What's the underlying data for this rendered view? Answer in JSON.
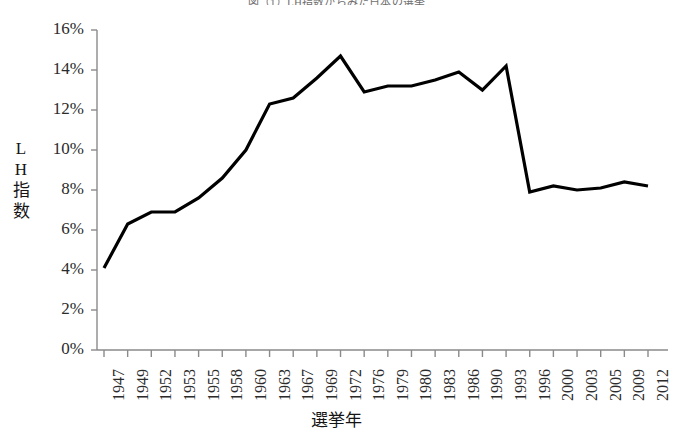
{
  "chart_data": {
    "type": "line",
    "title": "図（1）LH指数からみた日本の選挙",
    "xlabel": "選挙年",
    "ylabel": "LH指数",
    "categories": [
      "1947",
      "1949",
      "1952",
      "1953",
      "1955",
      "1958",
      "1960",
      "1963",
      "1967",
      "1969",
      "1972",
      "1976",
      "1979",
      "1980",
      "1983",
      "1986",
      "1990",
      "1993",
      "1996",
      "2000",
      "2003",
      "2005",
      "2009",
      "2012"
    ],
    "values": [
      4.1,
      6.3,
      6.9,
      6.9,
      7.6,
      8.6,
      10.0,
      12.3,
      12.6,
      13.6,
      14.7,
      12.9,
      13.2,
      13.2,
      13.5,
      13.9,
      13.0,
      14.2,
      7.9,
      8.2,
      8.0,
      8.1,
      8.4,
      8.2
    ],
    "ylim": [
      0,
      16
    ],
    "ytick_labels": [
      "0%",
      "2%",
      "4%",
      "6%",
      "8%",
      "10%",
      "12%",
      "14%",
      "16%"
    ],
    "ytick_values": [
      0,
      2,
      4,
      6,
      8,
      10,
      12,
      14,
      16
    ],
    "grid": false,
    "legend": null,
    "line_color": "#000000",
    "axis_color": "#8a8a8a",
    "series": [
      {
        "name": "LH指数",
        "values": [
          4.1,
          6.3,
          6.9,
          6.9,
          7.6,
          8.6,
          10.0,
          12.3,
          12.6,
          13.6,
          14.7,
          12.9,
          13.2,
          13.2,
          13.5,
          13.9,
          13.0,
          14.2,
          7.9,
          8.2,
          8.0,
          8.1,
          8.4,
          8.2
        ]
      }
    ]
  },
  "y_axis_title_chars": [
    "L",
    "H",
    "指",
    "数"
  ]
}
